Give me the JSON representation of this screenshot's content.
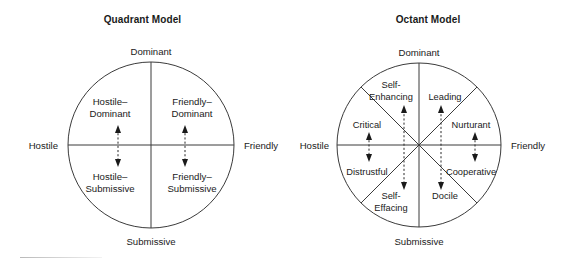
{
  "figure": {
    "panels": [
      {
        "id": "quadrant",
        "title": "Quadrant Model",
        "axes": {
          "top": "Dominant",
          "bottom": "Submissive",
          "left": "Hostile",
          "right": "Friendly"
        },
        "sectors": [
          {
            "id": "hostile-dominant",
            "line1": "Hostile–",
            "line2": "Dominant"
          },
          {
            "id": "friendly-dominant",
            "line1": "Friendly–",
            "line2": "Dominant"
          },
          {
            "id": "hostile-submissive",
            "line1": "Hostile–",
            "line2": "Submissive"
          },
          {
            "id": "friendly-submissive",
            "line1": "Friendly–",
            "line2": "Submissive"
          }
        ]
      },
      {
        "id": "octant",
        "title": "Octant Model",
        "axes": {
          "top": "Dominant",
          "bottom": "Submissive",
          "left": "Hostile",
          "right": "Friendly"
        },
        "sectors": [
          {
            "id": "self-enhancing",
            "line1": "Self-",
            "line2": "Enhancing"
          },
          {
            "id": "leading",
            "line1": "Leading",
            "line2": ""
          },
          {
            "id": "nurturant",
            "line1": "Nurturant",
            "line2": ""
          },
          {
            "id": "cooperative",
            "line1": "Cooperative",
            "line2": ""
          },
          {
            "id": "docile",
            "line1": "Docile",
            "line2": ""
          },
          {
            "id": "self-effacing",
            "line1": "Self-",
            "line2": "Effacing"
          },
          {
            "id": "distrustful",
            "line1": "Distrustful",
            "line2": ""
          },
          {
            "id": "critical",
            "line1": "Critical",
            "line2": ""
          }
        ]
      }
    ]
  }
}
